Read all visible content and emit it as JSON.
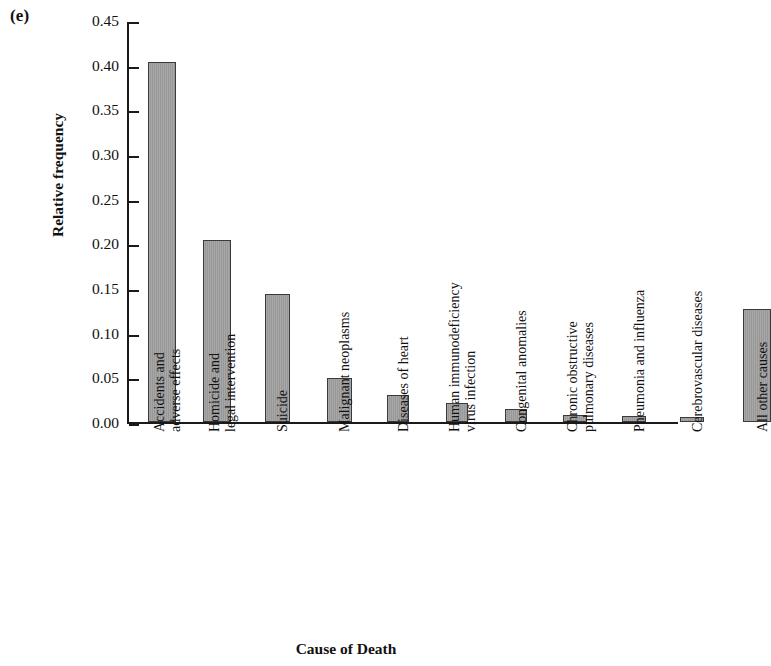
{
  "figure": {
    "panel_label": "(e)",
    "xlabel": "Cause of Death",
    "ylabel": "Relative frequency"
  },
  "chart_data": {
    "type": "bar",
    "title": "",
    "xlabel": "Cause of Death",
    "ylabel": "Relative frequency",
    "ylim": [
      0.0,
      0.45
    ],
    "ytick_labels": [
      "0.00",
      "0.05",
      "0.10",
      "0.15",
      "0.20",
      "0.25",
      "0.30",
      "0.35",
      "0.40",
      "0.45"
    ],
    "ytick_values": [
      0.0,
      0.05,
      0.1,
      0.15,
      0.2,
      0.25,
      0.3,
      0.35,
      0.4,
      0.45
    ],
    "grid": false,
    "legend": "none",
    "bar_color": "#9d9d9d",
    "bar_edge_color": "#3a3a3a",
    "categories": [
      "Accidents and adverse effects",
      "Homicide and legal intervention",
      "Suicide",
      "Malignant neoplasms",
      "Diseases of heart",
      "Human immunodeficiency virus infection",
      "Congenital anomalies",
      "Chronic obstructive pulmonary diseases",
      "Pneumonia and influenza",
      "Cerebrovascular diseases",
      "All other causes"
    ],
    "category_lines": [
      [
        "Accidents and",
        "adverse effects"
      ],
      [
        "Homicide and",
        "legal intervention"
      ],
      [
        "Suicide"
      ],
      [
        "Malignant neoplasms"
      ],
      [
        "Diseases of heart"
      ],
      [
        "Human immunodeficiency",
        "virus infection"
      ],
      [
        "Congenital anomalies"
      ],
      [
        "Chronic obstructive",
        "pulmonary diseases"
      ],
      [
        "Pneumonia and influenza"
      ],
      [
        "Cerebrovascular diseases"
      ],
      [
        "All other causes"
      ]
    ],
    "values": [
      0.403,
      0.204,
      0.143,
      0.049,
      0.03,
      0.021,
      0.015,
      0.008,
      0.007,
      0.006,
      0.126
    ]
  }
}
